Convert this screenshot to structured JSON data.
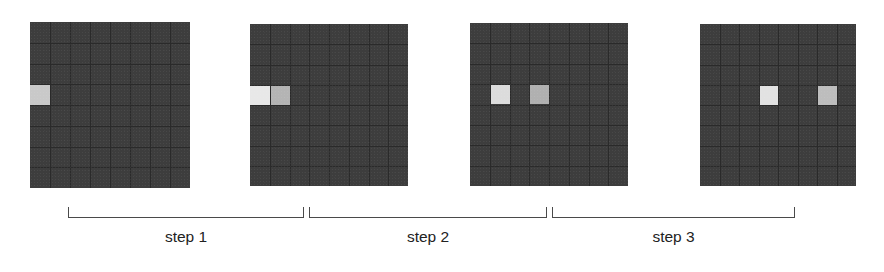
{
  "figure": {
    "title": "",
    "background_color": "#ffffff",
    "grid_count": 4,
    "grid_rows": 8,
    "grid_cols": 8,
    "grid_background_color": "#3d3d3d",
    "gridline_color": "#2a2a2a",
    "bracket_color": "#4a4a4a",
    "label_color": "#222222"
  },
  "grids": [
    {
      "name": "grid-panel-1",
      "index": 1,
      "x": 30,
      "y": 22,
      "width": 160,
      "height": 166,
      "highlighted_cells": [
        {
          "row": 3,
          "col": 0,
          "color": "#c9c9c9",
          "label": "bright-cell"
        }
      ]
    },
    {
      "name": "grid-panel-2",
      "index": 2,
      "x": 250,
      "y": 24,
      "width": 158,
      "height": 162,
      "highlighted_cells": [
        {
          "row": 3,
          "col": 0,
          "color": "#e8e8e8",
          "label": "bright-cell"
        },
        {
          "row": 3,
          "col": 1,
          "color": "#b4b4b4",
          "label": "dim-cell"
        }
      ]
    },
    {
      "name": "grid-panel-3",
      "index": 3,
      "x": 470,
      "y": 23,
      "width": 158,
      "height": 163,
      "highlighted_cells": [
        {
          "row": 3,
          "col": 1,
          "color": "#dcdcdc",
          "label": "bright-cell"
        },
        {
          "row": 3,
          "col": 3,
          "color": "#b0b0b0",
          "label": "dim-cell"
        }
      ]
    },
    {
      "name": "grid-panel-4",
      "index": 4,
      "x": 700,
      "y": 24,
      "width": 156,
      "height": 162,
      "highlighted_cells": [
        {
          "row": 3,
          "col": 3,
          "color": "#e2e2e2",
          "label": "bright-cell"
        },
        {
          "row": 3,
          "col": 6,
          "color": "#bdbdbd",
          "label": "dim-cell"
        }
      ]
    }
  ],
  "brackets": [
    {
      "name": "bracket-step-1",
      "x": 68,
      "y": 207,
      "width": 236,
      "label": "step 1",
      "label_x": 68,
      "label_y": 228,
      "label_width": 236
    },
    {
      "name": "bracket-step-2",
      "x": 309,
      "y": 207,
      "width": 238,
      "label": "step 2",
      "label_x": 309,
      "label_y": 228,
      "label_width": 238
    },
    {
      "name": "bracket-step-3",
      "x": 552,
      "y": 207,
      "width": 243,
      "label": "step 3",
      "label_x": 552,
      "label_y": 228,
      "label_width": 243
    }
  ],
  "chart_data": {
    "type": "heatmap",
    "title": "",
    "subtitle": "",
    "xlabel": "",
    "ylabel": "",
    "panels": [
      {
        "panel": 1,
        "step_after": "step 1",
        "active_cells": [
          [
            3,
            0
          ]
        ],
        "separation_columns": 0
      },
      {
        "panel": 2,
        "step_after": "step 2",
        "active_cells": [
          [
            3,
            0
          ],
          [
            3,
            1
          ]
        ],
        "separation_columns": 1
      },
      {
        "panel": 3,
        "step_after": "step 3",
        "active_cells": [
          [
            3,
            1
          ],
          [
            3,
            3
          ]
        ],
        "separation_columns": 2
      },
      {
        "panel": 4,
        "step_after": "",
        "active_cells": [
          [
            3,
            3
          ],
          [
            3,
            6
          ]
        ],
        "separation_columns": 3
      }
    ],
    "annotations": [
      "step 1",
      "step 2",
      "step 3"
    ],
    "legend": [],
    "grid": true
  }
}
